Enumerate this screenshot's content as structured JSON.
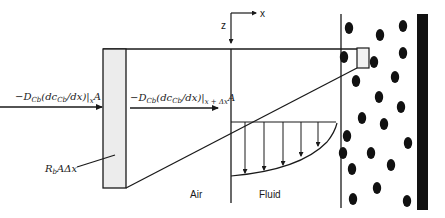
{
  "diagram": {
    "labels": {
      "flux_in_prefix": "−D",
      "flux_in_sub1": "Cb",
      "flux_in_mid": "(dc",
      "flux_in_sub2": "Cb",
      "flux_in_end": "/dx)|",
      "flux_in_eval": "x",
      "flux_in_area": "A",
      "flux_out_prefix": "−D",
      "flux_out_sub1": "Cb",
      "flux_out_mid": "(dc",
      "flux_out_sub2": "Cb",
      "flux_out_end": "/dx)|",
      "flux_out_eval": "x + Δx",
      "flux_out_area": "A",
      "reaction_main": "R",
      "reaction_sub": "b",
      "reaction_tail": "AΔx",
      "axis_z": "z",
      "axis_x": "x",
      "region_air": "Air",
      "region_fluid": "Fluid"
    },
    "colors": {
      "line": "#1a1a1a",
      "element_fill": "#ececec",
      "particle": "#111111",
      "wall": "#111111"
    },
    "control_volume": {
      "x": 103,
      "y": 49,
      "width": 23,
      "height": 139
    },
    "small_element": {
      "x": 357,
      "y": 48,
      "width": 12,
      "height": 20
    },
    "velocity_profile_arrows_x": [
      245,
      264,
      283,
      301,
      318
    ],
    "particles": [
      {
        "cx": 349,
        "cy": 28
      },
      {
        "cx": 380,
        "cy": 35
      },
      {
        "cx": 403,
        "cy": 26
      },
      {
        "cx": 344,
        "cy": 57
      },
      {
        "cx": 374,
        "cy": 62
      },
      {
        "cx": 403,
        "cy": 53
      },
      {
        "cx": 356,
        "cy": 81
      },
      {
        "cx": 395,
        "cy": 77
      },
      {
        "cx": 379,
        "cy": 97
      },
      {
        "cx": 401,
        "cy": 107
      },
      {
        "cx": 362,
        "cy": 118
      },
      {
        "cx": 384,
        "cy": 124
      },
      {
        "cx": 347,
        "cy": 136
      },
      {
        "cx": 408,
        "cy": 143
      },
      {
        "cx": 343,
        "cy": 153
      },
      {
        "cx": 371,
        "cy": 153
      },
      {
        "cx": 352,
        "cy": 169
      },
      {
        "cx": 391,
        "cy": 165
      },
      {
        "cx": 377,
        "cy": 188
      },
      {
        "cx": 353,
        "cy": 199
      },
      {
        "cx": 407,
        "cy": 201
      }
    ]
  }
}
